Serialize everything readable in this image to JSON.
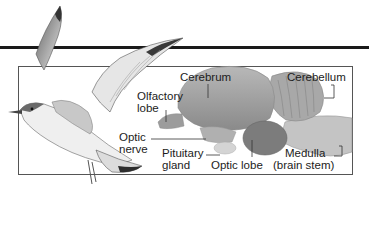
{
  "figure": {
    "illustrations": [
      "bird-in-flight",
      "brain-cross-section"
    ],
    "labels": {
      "cerebrum": "Cerebrum",
      "cerebellum": "Cerebellum",
      "olfactory_lobe": [
        "Olfactory",
        "lobe"
      ],
      "optic_nerve": [
        "Optic",
        "nerve"
      ],
      "pituitary_gland": [
        "Pituitary",
        "gland"
      ],
      "optic_lobe": "Optic lobe",
      "medulla": [
        "Medulla",
        "(brain stem)"
      ]
    }
  }
}
